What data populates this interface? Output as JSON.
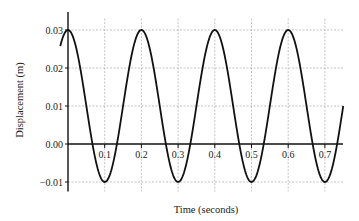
{
  "chart_data": {
    "type": "line",
    "title": "",
    "xlabel": "Time (seconds)",
    "ylabel": "Displacement (m)",
    "xlim": [
      0,
      0.75
    ],
    "ylim": [
      -0.012,
      0.035
    ],
    "grid": true,
    "x_ticks": [
      "0.1",
      "0.2",
      "0.3",
      "0.4",
      "0.5",
      "0.6",
      "0.7"
    ],
    "y_ticks": [
      "−0.01",
      "0.00",
      "0.01",
      "0.02",
      "0.03"
    ],
    "series": [
      {
        "name": "displacement",
        "equation": "y = 0.01 + 0.02*cos(2*pi*t/0.2)",
        "x": [
          0,
          0.05,
          0.1,
          0.15,
          0.2,
          0.25,
          0.3,
          0.35,
          0.4,
          0.45,
          0.5,
          0.55,
          0.6,
          0.65,
          0.7,
          0.75
        ],
        "values": [
          0.03,
          0.01,
          -0.01,
          0.01,
          0.03,
          0.01,
          -0.01,
          0.01,
          0.03,
          0.01,
          -0.01,
          0.01,
          0.03,
          0.01,
          -0.01,
          0.01
        ]
      }
    ]
  }
}
